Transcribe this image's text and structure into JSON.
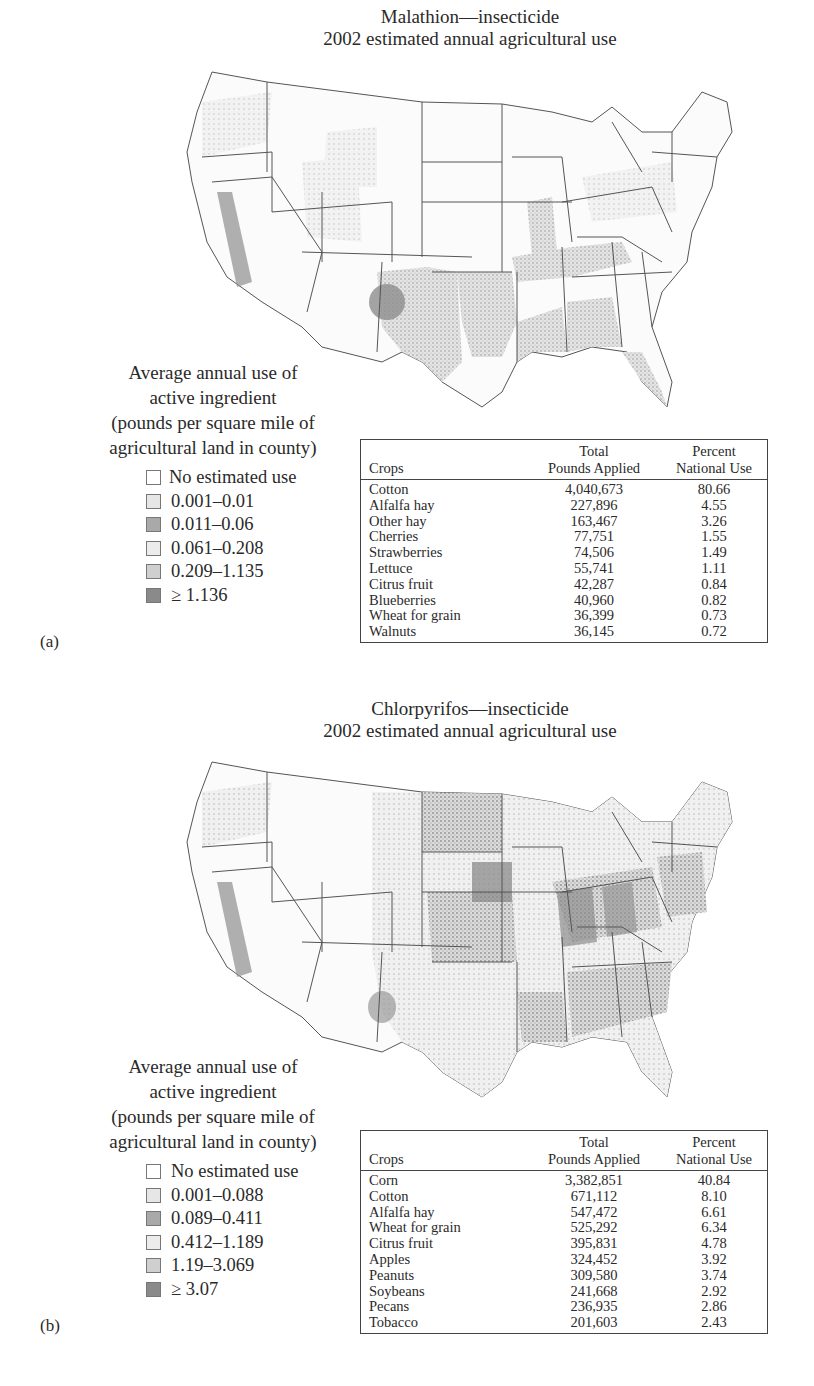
{
  "figures": [
    {
      "panel_label": "(a)",
      "title_line1": "Malathion—insecticide",
      "title_line2": "2002 estimated annual agricultural use",
      "legend": {
        "heading": [
          "Average annual use of",
          "active ingredient",
          "(pounds per square mile of",
          "agricultural land in county)"
        ],
        "items": [
          {
            "label": "No estimated use",
            "color": "#ffffff"
          },
          {
            "label": "0.001–0.01",
            "color": "#e6e6e6"
          },
          {
            "label": "0.011–0.06",
            "color": "#a9a9a9"
          },
          {
            "label": "0.061–0.208",
            "color": "#ececec"
          },
          {
            "label": "0.209–1.135",
            "color": "#cfcfcf"
          },
          {
            "label": "≥ 1.136",
            "color": "#8a8a8a"
          }
        ]
      },
      "table": {
        "headers": {
          "crops": "Crops",
          "pounds_l1": "Total",
          "pounds_l2": "Pounds Applied",
          "percent_l1": "Percent",
          "percent_l2": "National Use"
        },
        "rows": [
          {
            "crop": "Cotton",
            "pounds": "4,040,673",
            "percent": "80.66"
          },
          {
            "crop": "Alfalfa hay",
            "pounds": "227,896",
            "percent": "4.55"
          },
          {
            "crop": "Other hay",
            "pounds": "163,467",
            "percent": "3.26"
          },
          {
            "crop": "Cherries",
            "pounds": "77,751",
            "percent": "1.55"
          },
          {
            "crop": "Strawberries",
            "pounds": "74,506",
            "percent": "1.49"
          },
          {
            "crop": "Lettuce",
            "pounds": "55,741",
            "percent": "1.11"
          },
          {
            "crop": "Citrus fruit",
            "pounds": "42,287",
            "percent": "0.84"
          },
          {
            "crop": "Blueberries",
            "pounds": "40,960",
            "percent": "0.82"
          },
          {
            "crop": "Wheat for grain",
            "pounds": "36,399",
            "percent": "0.73"
          },
          {
            "crop": "Walnuts",
            "pounds": "36,145",
            "percent": "0.72"
          }
        ]
      }
    },
    {
      "panel_label": "(b)",
      "title_line1": "Chlorpyrifos—insecticide",
      "title_line2": "2002 estimated annual agricultural use",
      "legend": {
        "heading": [
          "Average annual use of",
          "active ingredient",
          "(pounds per square mile of",
          "agricultural land in county)"
        ],
        "items": [
          {
            "label": "No estimated use",
            "color": "#ffffff"
          },
          {
            "label": "0.001–0.088",
            "color": "#e6e6e6"
          },
          {
            "label": "0.089–0.411",
            "color": "#a9a9a9"
          },
          {
            "label": "0.412–1.189",
            "color": "#ececec"
          },
          {
            "label": "1.19–3.069",
            "color": "#cfcfcf"
          },
          {
            "label": "≥ 3.07",
            "color": "#8a8a8a"
          }
        ]
      },
      "table": {
        "headers": {
          "crops": "Crops",
          "pounds_l1": "Total",
          "pounds_l2": "Pounds Applied",
          "percent_l1": "Percent",
          "percent_l2": "National Use"
        },
        "rows": [
          {
            "crop": "Corn",
            "pounds": "3,382,851",
            "percent": "40.84"
          },
          {
            "crop": "Cotton",
            "pounds": "671,112",
            "percent": "8.10"
          },
          {
            "crop": "Alfalfa hay",
            "pounds": "547,472",
            "percent": "6.61"
          },
          {
            "crop": "Wheat for grain",
            "pounds": "525,292",
            "percent": "6.34"
          },
          {
            "crop": "Citrus fruit",
            "pounds": "395,831",
            "percent": "4.78"
          },
          {
            "crop": "Apples",
            "pounds": "324,452",
            "percent": "3.92"
          },
          {
            "crop": "Peanuts",
            "pounds": "309,580",
            "percent": "3.74"
          },
          {
            "crop": "Soybeans",
            "pounds": "241,668",
            "percent": "2.92"
          },
          {
            "crop": "Pecans",
            "pounds": "236,935",
            "percent": "2.86"
          },
          {
            "crop": "Tobacco",
            "pounds": "201,603",
            "percent": "2.43"
          }
        ]
      }
    }
  ]
}
